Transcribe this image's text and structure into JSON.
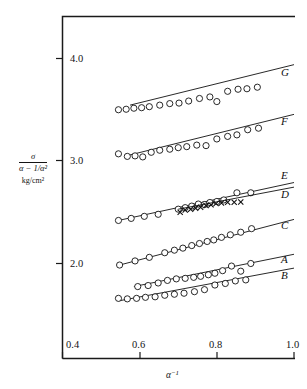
{
  "figure": {
    "kind": "scientific-plot",
    "background": "#ffffff",
    "ink_color": "#111111"
  },
  "axes": {
    "x": {
      "label_parts": {
        "base": "α",
        "exponent": "−1"
      },
      "label_plain": "α⁻¹",
      "ticks": [
        "0.4",
        "0.6",
        "0.8",
        "1.0"
      ],
      "tick_values": [
        0.4,
        0.6,
        0.8,
        1.0
      ],
      "range": [
        0.4,
        1.0
      ]
    },
    "y": {
      "label_numerator": "σ",
      "label_denominator": "α − 1/α²",
      "label_units": "kg/cm²",
      "label_plain": "σ / (α − 1/α²), kg/cm²",
      "ticks": [
        "4.0",
        "3.0",
        "2.0"
      ],
      "tick_values": [
        4.0,
        3.0,
        2.0
      ],
      "range": [
        1.35,
        4.35
      ]
    }
  },
  "chart_data": {
    "type": "scatter",
    "title": "",
    "xlabel": "α⁻¹",
    "ylabel": "σ/(α − 1/α²), kg/cm²",
    "xlim": [
      0.4,
      1.0
    ],
    "ylim": [
      1.35,
      4.35
    ],
    "xticks": [
      0.4,
      0.6,
      0.8,
      1.0
    ],
    "yticks": [
      2.0,
      3.0,
      4.0
    ],
    "grid": false,
    "legend": "curve-labels-at-right",
    "series": [
      {
        "name": "G",
        "label": "G",
        "marker": "open-circle",
        "fit_line": {
          "x": [
            0.575,
            1.0
          ],
          "y": [
            3.545,
            3.94
          ]
        },
        "x": [
          0.545,
          0.565,
          0.585,
          0.605,
          0.625,
          0.652,
          0.678,
          0.702,
          0.727,
          0.755,
          0.782,
          0.8,
          0.828,
          0.855,
          0.878,
          0.905
        ],
        "y": [
          3.5,
          3.505,
          3.515,
          3.52,
          3.53,
          3.545,
          3.56,
          3.565,
          3.585,
          3.61,
          3.625,
          3.58,
          3.68,
          3.7,
          3.705,
          3.72
        ]
      },
      {
        "name": "F",
        "label": "F",
        "marker": "open-circle",
        "fit_line": {
          "x": [
            0.565,
            1.0
          ],
          "y": [
            3.05,
            3.455
          ]
        },
        "x": [
          0.545,
          0.568,
          0.588,
          0.608,
          0.63,
          0.652,
          0.678,
          0.7,
          0.722,
          0.748,
          0.772,
          0.8,
          0.828,
          0.852,
          0.88,
          0.908
        ],
        "y": [
          3.07,
          3.045,
          3.05,
          3.04,
          3.085,
          3.105,
          3.115,
          3.13,
          3.14,
          3.155,
          3.15,
          3.215,
          3.24,
          3.255,
          3.305,
          3.32
        ]
      },
      {
        "name": "E",
        "label": "E",
        "marker": "open-circle",
        "fit_line": {
          "x": [
            0.545,
            1.0
          ],
          "y": [
            2.42,
            2.79
          ]
        },
        "x": [
          0.545,
          0.578,
          0.612,
          0.648,
          0.7,
          0.718,
          0.735,
          0.752,
          0.768,
          0.782,
          0.8,
          0.818,
          0.852,
          0.888
        ],
        "y": [
          2.42,
          2.44,
          2.46,
          2.48,
          2.53,
          2.545,
          2.56,
          2.58,
          2.575,
          2.595,
          2.605,
          2.62,
          2.69,
          2.69
        ]
      },
      {
        "name": "D",
        "label": "D",
        "marker": "cross",
        "fit_line": {
          "x": [
            0.7,
            1.0
          ],
          "y": [
            2.53,
            2.745
          ]
        },
        "x": [
          0.705,
          0.718,
          0.732,
          0.745,
          0.758,
          0.772,
          0.785,
          0.798,
          0.812,
          0.828,
          0.845,
          0.862
        ],
        "y": [
          2.5,
          2.522,
          2.53,
          2.54,
          2.548,
          2.565,
          2.572,
          2.585,
          2.59,
          2.598,
          2.598,
          2.6
        ]
      },
      {
        "name": "C",
        "label": "C",
        "marker": "open-circle",
        "fit_line": {
          "x": [
            0.548,
            1.0
          ],
          "y": [
            1.985,
            2.43
          ]
        },
        "x": [
          0.548,
          0.588,
          0.625,
          0.665,
          0.69,
          0.712,
          0.735,
          0.755,
          0.775,
          0.792,
          0.812,
          0.835,
          0.862,
          0.89
        ],
        "y": [
          1.985,
          2.025,
          2.06,
          2.105,
          2.13,
          2.15,
          2.175,
          2.195,
          2.215,
          2.23,
          2.255,
          2.28,
          2.305,
          2.34
        ]
      },
      {
        "name": "A",
        "label": "A",
        "marker": "open-circle",
        "fit_line": {
          "x": [
            0.585,
            1.0
          ],
          "y": [
            1.775,
            2.09
          ]
        },
        "x": [
          0.595,
          0.622,
          0.648,
          0.672,
          0.695,
          0.718,
          0.74,
          0.758,
          0.778,
          0.795,
          0.815,
          0.838,
          0.862,
          0.888
        ],
        "y": [
          1.775,
          1.785,
          1.81,
          1.835,
          1.85,
          1.855,
          1.865,
          1.875,
          1.89,
          1.905,
          1.93,
          1.975,
          1.925,
          2.0
        ]
      },
      {
        "name": "B",
        "label": "B",
        "marker": "open-circle",
        "fit_line": {
          "x": [
            0.545,
            1.0
          ],
          "y": [
            1.635,
            1.955
          ]
        },
        "x": [
          0.545,
          0.568,
          0.592,
          0.615,
          0.64,
          0.665,
          0.69,
          0.715,
          0.742,
          0.768,
          0.795,
          0.822,
          0.848,
          0.875
        ],
        "y": [
          1.66,
          1.655,
          1.66,
          1.67,
          1.675,
          1.69,
          1.7,
          1.71,
          1.725,
          1.745,
          1.79,
          1.805,
          1.83,
          1.84
        ]
      }
    ]
  },
  "curve_labels": [
    {
      "id": "G",
      "text": "G"
    },
    {
      "id": "F",
      "text": "F"
    },
    {
      "id": "E",
      "text": "E"
    },
    {
      "id": "D",
      "text": "D"
    },
    {
      "id": "C",
      "text": "C"
    },
    {
      "id": "A",
      "text": "A"
    },
    {
      "id": "B",
      "text": "B"
    }
  ]
}
